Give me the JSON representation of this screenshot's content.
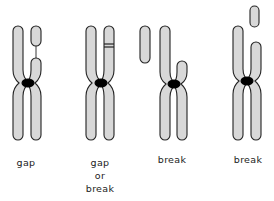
{
  "figure": {
    "type": "chromosome-aberration-diagram",
    "colors": {
      "chromatid_fill": "#d8d8d8",
      "outline": "#222222",
      "centromere": "#000000",
      "background": "#ffffff"
    },
    "panels": [
      {
        "id": "gap",
        "label_lines": [
          "gap"
        ]
      },
      {
        "id": "gap-or-break",
        "label_lines": [
          "gap",
          "or",
          "break"
        ]
      },
      {
        "id": "break-1",
        "label_lines": [
          "break"
        ]
      },
      {
        "id": "break-2",
        "label_lines": [
          "break"
        ]
      }
    ]
  }
}
